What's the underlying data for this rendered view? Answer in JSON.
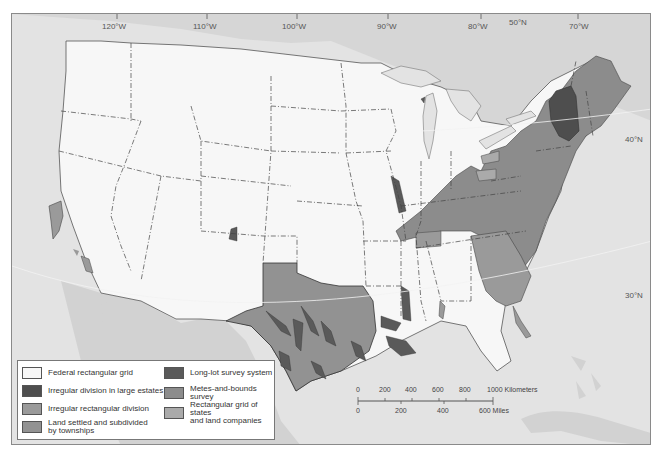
{
  "map": {
    "graticule": {
      "longitudes": [
        {
          "label": "120°W",
          "x": 111
        },
        {
          "label": "110°W",
          "x": 202
        },
        {
          "label": "100°W",
          "x": 291
        },
        {
          "label": "90°W",
          "x": 386
        },
        {
          "label": "80°W",
          "x": 477
        },
        {
          "label": "70°W",
          "x": 578
        }
      ],
      "latitudes": [
        {
          "label": "50°N",
          "x": 508,
          "y": 18
        },
        {
          "label": "40°N",
          "x": 624,
          "y": 134
        },
        {
          "label": "30°N",
          "x": 624,
          "y": 290
        }
      ]
    },
    "colors": {
      "water": "#e3e3e3",
      "neighbor_land": "#d2d2d2",
      "federal_grid": "#f7f7f7",
      "large_estates": "#4e4e4e",
      "irregular_rectangular": "#9a9a9a",
      "townships": "#929292",
      "long_lot": "#5a5a5a",
      "metes_and_bounds": "#8c8c8c",
      "states_land_companies": "#aaaaaa",
      "border": "#444444"
    }
  },
  "legend": {
    "items": [
      {
        "label": "Federal rectangular grid",
        "color": "#f7f7f7"
      },
      {
        "label": "Irregular division in large estates",
        "color": "#4e4e4e"
      },
      {
        "label": "Irregular rectangular division",
        "color": "#9a9a9a"
      },
      {
        "label": "Land settled and subdivided by townships",
        "color": "#929292"
      },
      {
        "label": "Long-lot survey system",
        "color": "#5a5a5a"
      },
      {
        "label": "Metes-and-bounds survey",
        "color": "#8c8c8c"
      },
      {
        "label": "Rectangular grid of states and land companies",
        "color": "#aaaaaa"
      }
    ],
    "labels": {
      "federal": "Federal rectangular grid",
      "estates": "Irregular division in large estates",
      "irregular_rect": "Irregular rectangular division",
      "townships_1": "Land settled and subdivided",
      "townships_2": "by townships",
      "long_lot": "Long-lot survey system",
      "metes": "Metes-and-bounds survey",
      "states_1": "Rectangular grid of states",
      "states_2": "and land companies"
    }
  },
  "scale_bar": {
    "km_ticks": [
      "0",
      "200",
      "400",
      "600",
      "800",
      "1000 Kilometers"
    ],
    "mile_ticks": [
      "0",
      "200",
      "400",
      "600 Miles"
    ]
  }
}
